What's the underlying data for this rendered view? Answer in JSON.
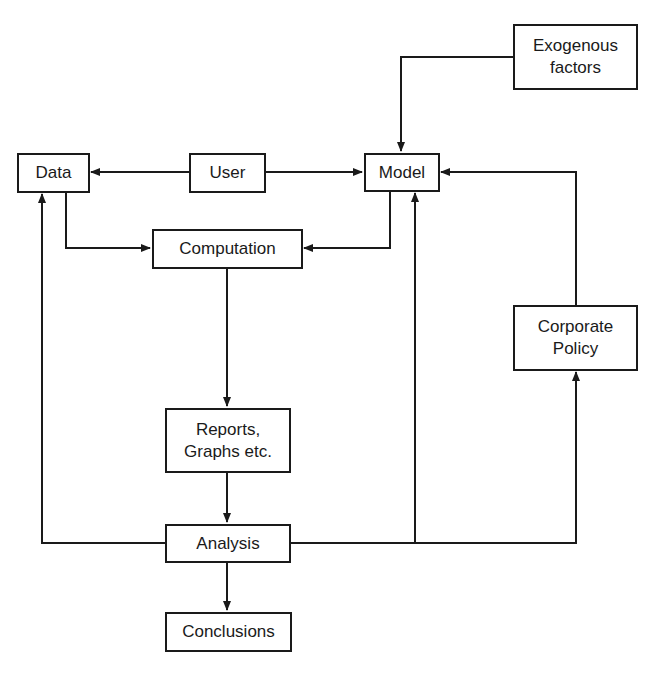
{
  "diagram": {
    "type": "flowchart",
    "nodes": {
      "data": {
        "label": "Data"
      },
      "user": {
        "label": "User"
      },
      "model": {
        "label": "Model"
      },
      "exogenous": {
        "label": "Exogenous\nfactors"
      },
      "computation": {
        "label": "Computation"
      },
      "corporate_policy": {
        "label": "Corporate\nPolicy"
      },
      "reports": {
        "label": "Reports,\nGraphs etc."
      },
      "analysis": {
        "label": "Analysis"
      },
      "conclusions": {
        "label": "Conclusions"
      }
    },
    "edges": [
      {
        "from": "User",
        "to": "Data"
      },
      {
        "from": "User",
        "to": "Model"
      },
      {
        "from": "Exogenous factors",
        "to": "Model"
      },
      {
        "from": "Corporate Policy",
        "to": "Model"
      },
      {
        "from": "Data",
        "to": "Computation"
      },
      {
        "from": "Model",
        "to": "Computation"
      },
      {
        "from": "Computation",
        "to": "Reports, Graphs etc."
      },
      {
        "from": "Reports, Graphs etc.",
        "to": "Analysis"
      },
      {
        "from": "Analysis",
        "to": "Conclusions"
      },
      {
        "from": "Analysis",
        "to": "Data"
      },
      {
        "from": "Analysis",
        "to": "Model"
      },
      {
        "from": "Analysis",
        "to": "Corporate Policy"
      }
    ],
    "colors": {
      "line": "#1a1a1a",
      "background": "#ffffff"
    }
  }
}
